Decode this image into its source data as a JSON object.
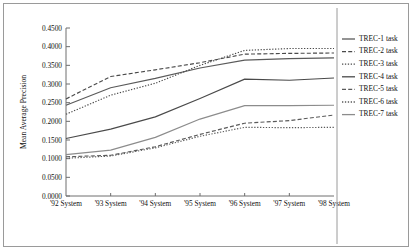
{
  "chart_data": {
    "type": "line",
    "title": "",
    "xlabel": "",
    "ylabel": "Mean Average Precision",
    "categories": [
      "'92 System",
      "'93 System",
      "'94 System",
      "'95 System",
      "'96 System",
      "'97 System",
      "'98 System"
    ],
    "ylim": [
      0.0,
      0.45
    ],
    "ytick_labels": [
      "0.0000",
      "0.0500",
      "0.1000",
      "0.1500",
      "0.2000",
      "0.2500",
      "0.3000",
      "0.3500",
      "0.4000",
      "0.4500"
    ],
    "ytick_values": [
      0.0,
      0.05,
      0.1,
      0.15,
      0.2,
      0.25,
      0.3,
      0.35,
      0.4,
      0.45
    ],
    "grid": false,
    "legend_position": "right",
    "series": [
      {
        "name": "TREC-1 task",
        "style": "solid",
        "color": "#5a5a5a",
        "values": [
          0.243,
          0.29,
          0.315,
          0.343,
          0.364,
          0.368,
          0.37
        ]
      },
      {
        "name": "TREC-2 task",
        "style": "dashed",
        "color": "#4a4a4a",
        "values": [
          0.26,
          0.32,
          0.338,
          0.357,
          0.38,
          0.382,
          0.383
        ]
      },
      {
        "name": "TREC-3 task",
        "style": "dotted",
        "color": "#4a4a4a",
        "values": [
          0.219,
          0.27,
          0.302,
          0.35,
          0.39,
          0.395,
          0.395
        ]
      },
      {
        "name": "TREC-4 task",
        "style": "solid",
        "color": "#4a4a4a",
        "values": [
          0.154,
          0.179,
          0.212,
          0.261,
          0.313,
          0.31,
          0.316
        ]
      },
      {
        "name": "TREC-5 task",
        "style": "dashed",
        "color": "#5a5a5a",
        "values": [
          0.105,
          0.109,
          0.132,
          0.165,
          0.195,
          0.202,
          0.217
        ]
      },
      {
        "name": "TREC-6 task",
        "style": "dotted",
        "color": "#5a5a5a",
        "values": [
          0.101,
          0.107,
          0.129,
          0.16,
          0.184,
          0.183,
          0.184
        ]
      },
      {
        "name": "TREC-7 task",
        "style": "solid",
        "color": "#8c8c8c",
        "values": [
          0.111,
          0.123,
          0.157,
          0.206,
          0.242,
          0.242,
          0.243
        ]
      }
    ]
  },
  "axis": {
    "y_title": "Mean Average Precision"
  }
}
